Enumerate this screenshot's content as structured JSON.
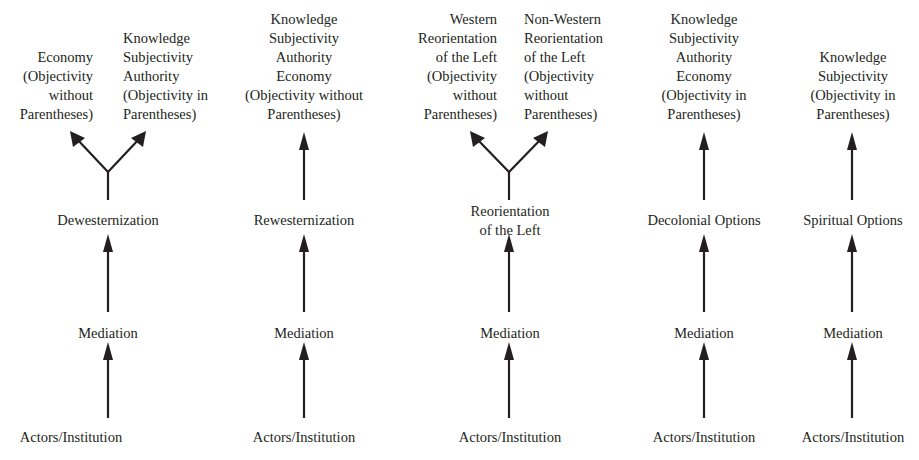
{
  "columns": [
    {
      "name": "dewesternization",
      "bottom": "Actors/Institution",
      "middle": "Mediation",
      "option": [
        "Dewesternization"
      ],
      "left_branch": [
        "Economy",
        "(Objectivity",
        "without",
        "Parentheses)"
      ],
      "right_branch": [
        "Knowledge",
        "Subjectivity",
        "Authority",
        "(Objectivity in",
        "Parentheses)"
      ]
    },
    {
      "name": "rewesternization",
      "bottom": "Actors/Institution",
      "middle": "Mediation",
      "option": [
        "Rewesternization"
      ],
      "top": [
        "Knowledge",
        "Subjectivity",
        "Authority",
        "Economy",
        "(Objectivity without",
        "Parentheses)"
      ]
    },
    {
      "name": "reorientation-of-the-left",
      "bottom": "Actors/Institution",
      "middle": "Mediation",
      "option": [
        "Reorientation",
        "of the Left"
      ],
      "left_branch": [
        "Western",
        "Reorientation",
        "of the Left",
        "(Objectivity",
        "without",
        "Parentheses)"
      ],
      "right_branch": [
        "Non-Western",
        "Reorientation",
        "of the Left",
        "(Objectivity",
        "without",
        "Parentheses)"
      ]
    },
    {
      "name": "decolonial-options",
      "bottom": "Actors/Institution",
      "middle": "Mediation",
      "option": [
        "Decolonial Options"
      ],
      "top": [
        "Knowledge",
        "Subjectivity",
        "Authority",
        "Economy",
        "(Objectivity in",
        "Parentheses)"
      ]
    },
    {
      "name": "spiritual-options",
      "bottom": "Actors/Institution",
      "middle": "Mediation",
      "option": [
        "Spiritual Options"
      ],
      "top": [
        "Knowledge",
        "Subjectivity",
        "(Objectivity in",
        "Parentheses)"
      ]
    }
  ],
  "colors": {
    "ink": "#231f20",
    "background": "#ffffff"
  }
}
